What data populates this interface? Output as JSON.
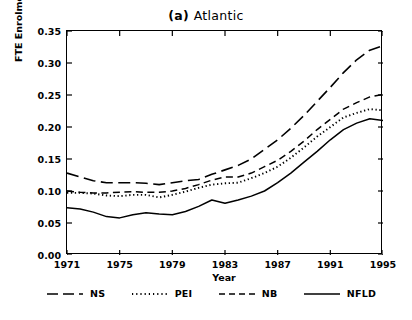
{
  "chart_data": {
    "type": "line",
    "title_bold": "(a)",
    "title_rest": "Atlantic",
    "title": "(a) Atlantic",
    "xlabel": "Year",
    "ylabel": "FTE Enrolment Rate",
    "xlim": [
      1971,
      1995
    ],
    "ylim": [
      0.0,
      0.35
    ],
    "xticks": [
      "1971",
      "1975",
      "1979",
      "1983",
      "1987",
      "1991",
      "1995"
    ],
    "xtick_values": [
      1971,
      1975,
      1979,
      1983,
      1987,
      1991,
      1995
    ],
    "yticks": [
      "0.00",
      "0.05",
      "0.10",
      "0.15",
      "0.20",
      "0.25",
      "0.30",
      "0.35"
    ],
    "ytick_values": [
      0.0,
      0.05,
      0.1,
      0.15,
      0.2,
      0.25,
      0.3,
      0.35
    ],
    "grid": false,
    "legend_position": "below-axes",
    "x": [
      1971,
      1972,
      1973,
      1974,
      1975,
      1976,
      1977,
      1978,
      1979,
      1980,
      1981,
      1982,
      1983,
      1984,
      1985,
      1986,
      1987,
      1988,
      1989,
      1990,
      1991,
      1992,
      1993,
      1994,
      1995
    ],
    "series": [
      {
        "name": "NS",
        "style": "long-dash",
        "values": [
          0.128,
          0.122,
          0.116,
          0.113,
          0.113,
          0.113,
          0.112,
          0.11,
          0.113,
          0.116,
          0.118,
          0.126,
          0.133,
          0.14,
          0.15,
          0.165,
          0.18,
          0.198,
          0.218,
          0.24,
          0.262,
          0.285,
          0.305,
          0.32,
          0.327
        ]
      },
      {
        "name": "PEI",
        "style": "dotted",
        "values": [
          0.097,
          0.097,
          0.096,
          0.093,
          0.092,
          0.094,
          0.094,
          0.09,
          0.094,
          0.099,
          0.105,
          0.11,
          0.112,
          0.113,
          0.12,
          0.128,
          0.138,
          0.152,
          0.168,
          0.185,
          0.2,
          0.215,
          0.222,
          0.228,
          0.226
        ]
      },
      {
        "name": "NB",
        "style": "short-dash",
        "values": [
          0.1,
          0.098,
          0.097,
          0.097,
          0.098,
          0.099,
          0.098,
          0.098,
          0.1,
          0.104,
          0.11,
          0.117,
          0.122,
          0.122,
          0.128,
          0.138,
          0.148,
          0.162,
          0.178,
          0.196,
          0.212,
          0.228,
          0.238,
          0.247,
          0.251
        ]
      },
      {
        "name": "NFLD",
        "style": "solid",
        "values": [
          0.074,
          0.072,
          0.067,
          0.06,
          0.058,
          0.063,
          0.066,
          0.064,
          0.063,
          0.068,
          0.076,
          0.086,
          0.081,
          0.086,
          0.092,
          0.1,
          0.113,
          0.128,
          0.145,
          0.162,
          0.18,
          0.196,
          0.206,
          0.213,
          0.21
        ]
      }
    ],
    "legend": [
      {
        "label": "NS",
        "style": "long-dash"
      },
      {
        "label": "PEI",
        "style": "dotted"
      },
      {
        "label": "NB",
        "style": "short-dash"
      },
      {
        "label": "NFLD",
        "style": "solid"
      }
    ],
    "colors": {
      "line": "#000000",
      "background": "#ffffff",
      "axis": "#000000"
    }
  }
}
